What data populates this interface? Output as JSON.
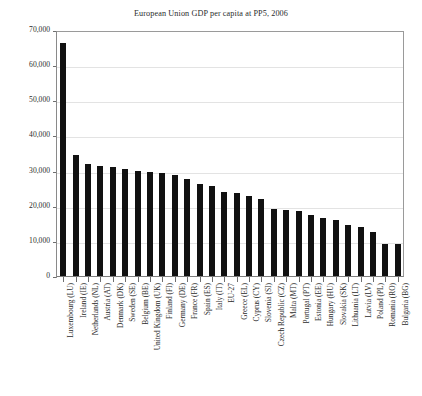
{
  "chart_data": {
    "type": "bar",
    "title": "European Union GDP per capita at PP5, 2006",
    "xlabel": "",
    "ylabel": "",
    "ylim": [
      0,
      70000
    ],
    "grid": true,
    "legend": "none",
    "orientation": "vertical",
    "bar_color": "#111111",
    "ytick_labels": [
      "70,000",
      "60,000",
      "50,000",
      "40,000",
      "30,000",
      "20,000",
      "10,000",
      "0"
    ],
    "ytick_values": [
      70000,
      60000,
      50000,
      40000,
      30000,
      20000,
      10000,
      0
    ],
    "categories": [
      "Luxembourg (LU)",
      "Ireland (IE)",
      "Netherlands (NL)",
      "Austria (AT)",
      "Denmark (DK)",
      "Sweden (SE)",
      "Belgium (BE)",
      "United Kingdom (UK)",
      "Finland (FI)",
      "Germany (DE)",
      "France (FR)",
      "Spain (ES)",
      "Italy (IT)",
      "EU-27",
      "Greece (EL)",
      "Cyprus (CY)",
      "Slovenia (SI)",
      "Czech Republic (CZ)",
      "Malta (MT)",
      "Portugal (PT)",
      "Estonia (EE)",
      "Hungary (HU)",
      "Slovakia (SK)",
      "Lithuania (LT)",
      "Latvia (LV)",
      "Poland (PL)",
      "Romania (RO)",
      "Bulgaria (BG)"
    ],
    "values": [
      66400,
      34500,
      32000,
      31200,
      31000,
      30500,
      30000,
      29700,
      29200,
      28800,
      27500,
      26200,
      25500,
      24000,
      23500,
      22800,
      22000,
      19200,
      18800,
      18500,
      17500,
      16500,
      16000,
      14500,
      14000,
      12500,
      9200,
      9000
    ]
  }
}
